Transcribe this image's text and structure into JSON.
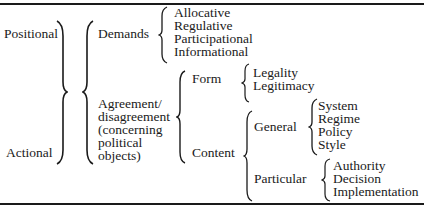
{
  "taxonomy": {
    "level1": [
      "Positional",
      "Actional"
    ],
    "demands": {
      "label": "Demands",
      "items": [
        "Allocative",
        "Regulative",
        "Participational",
        "Informational"
      ]
    },
    "agreement": {
      "label_lines": [
        "Agreement/",
        "disagreement",
        "(concerning",
        "political",
        "objects)"
      ],
      "form": {
        "label": "Form",
        "items": [
          "Legality",
          "Legitimacy"
        ]
      },
      "content": {
        "label": "Content",
        "general": {
          "label": "General",
          "items": [
            "System",
            "Regime",
            "Policy",
            "Style"
          ]
        },
        "particular": {
          "label": "Particular",
          "items": [
            "Authority",
            "Decision",
            "Implementation"
          ]
        }
      }
    }
  }
}
